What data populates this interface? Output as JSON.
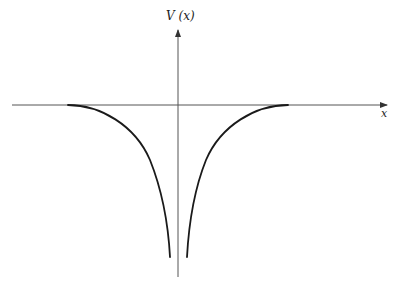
{
  "diagram": {
    "y_axis_label": "V (x)",
    "x_axis_label": "x",
    "colors": {
      "axis": "#555555",
      "curve": "#1a1a1a",
      "background": "#ffffff"
    },
    "axes": {
      "x_axis": {
        "x1": 12,
        "x2": 387,
        "y": 105
      },
      "y_axis": {
        "x": 178,
        "y1": 277,
        "y2": 30
      }
    },
    "curves": {
      "left_branch": "M 68 105 C 100 105, 135 125, 150 160 C 160 185, 168 220, 170 257",
      "right_branch": "M 288 105 C 256 105, 221 125, 206 160 C 196 185, 189 220, 187 257"
    }
  }
}
